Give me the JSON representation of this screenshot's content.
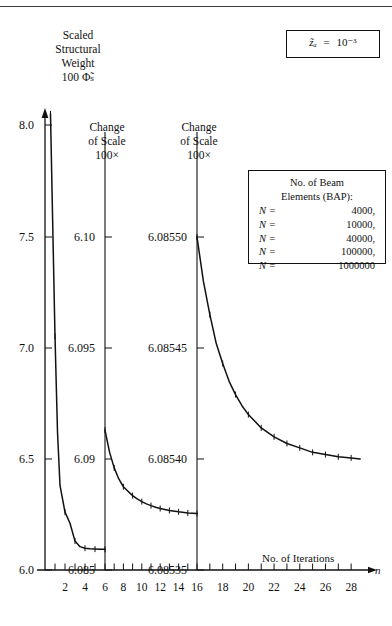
{
  "figure": {
    "top_rule": true,
    "y_axis_title_lines": [
      "Scaled",
      "Structural",
      "Weight",
      "100 Φ̃ₛ"
    ],
    "x_axis_title": "No. of Iterations",
    "x_axis_symbol": "n",
    "parameter_box": {
      "symbol": "z̃ₐ",
      "equals": "=",
      "value": "10⁻³"
    },
    "scale_change_1": {
      "line1": "Change",
      "line2": "of Scale",
      "line3": "100×"
    },
    "scale_change_2": {
      "line1": "Change",
      "line2": "of Scale",
      "line3": "100×"
    },
    "legend": {
      "title_line1": "No. of Beam",
      "title_line2": "Elements (BAP):",
      "entries": [
        {
          "label": "N =",
          "value": "4000,"
        },
        {
          "label": "N =",
          "value": "10000,"
        },
        {
          "label": "N =",
          "value": "40000,"
        },
        {
          "label": "N =",
          "value": "100000,"
        },
        {
          "label": "N =",
          "value": "1000000"
        }
      ]
    }
  },
  "chart_data": {
    "type": "line",
    "xlabel": "No. of Iterations",
    "ylabel": "Scaled Structural Weight 100 Φ̃_S",
    "xlim": [
      0,
      29
    ],
    "x_ticks_major": [
      2,
      4,
      6,
      8,
      10,
      12,
      14,
      16,
      18,
      20,
      22,
      24,
      26,
      28
    ],
    "x_ticks_minor": [
      1,
      3,
      5,
      7,
      9,
      11,
      13,
      15,
      17,
      19,
      21,
      23,
      25,
      27
    ],
    "grid": false,
    "legend_position": "top-right",
    "annotations": [
      "Change of Scale 100× at n=6",
      "Change of Scale 100× at n=16"
    ],
    "panels": [
      {
        "name": "panel-1",
        "x_range": [
          0,
          6
        ],
        "y_ticks": [
          "8.0",
          "7.5",
          "7.0",
          "6.5",
          "6.0"
        ],
        "y_values": [
          8.0,
          7.5,
          7.0,
          6.5,
          6.0
        ],
        "ylim": [
          5.93,
          8.08
        ],
        "series": [
          {
            "name": "N = 4000",
            "x": [
              0.55,
              0.75,
              1.0,
              1.25,
              1.5,
              2.0,
              2.5,
              3.0,
              3.5,
              4.0,
              4.5,
              5.0,
              5.5,
              6.0
            ],
            "y": [
              8.05,
              7.6,
              7.05,
              6.62,
              6.38,
              6.26,
              6.21,
              6.13,
              6.105,
              6.098,
              6.095,
              6.094,
              6.093,
              6.093
            ]
          }
        ]
      },
      {
        "name": "panel-2",
        "x_range": [
          6,
          16
        ],
        "y_ticks": [
          "6.10",
          "6.095",
          "6.09",
          "6.085"
        ],
        "y_values": [
          6.1,
          6.095,
          6.09,
          6.085
        ],
        "ylim": [
          6.0835,
          6.1013
        ],
        "series": [
          {
            "name": "N = 4000 (100x scale)",
            "x": [
              6.0,
              6.5,
              7.0,
              7.5,
              8.0,
              8.5,
              9.0,
              9.5,
              10.0,
              10.5,
              11.0,
              11.5,
              12.0,
              13.0,
              14.0,
              15.0,
              16.0
            ],
            "y": [
              6.0913,
              6.0903,
              6.0896,
              6.0891,
              6.08875,
              6.08855,
              6.08835,
              6.0882,
              6.08808,
              6.08798,
              6.0879,
              6.08783,
              6.08777,
              6.08768,
              6.08762,
              6.08757,
              6.08754
            ]
          }
        ]
      },
      {
        "name": "panel-3",
        "x_range": [
          16,
          29
        ],
        "y_ticks": [
          "6.08550",
          "6.08545",
          "6.08540",
          "6.08535"
        ],
        "y_values": [
          6.0855,
          6.08545,
          6.0854,
          6.08535
        ],
        "ylim": [
          6.085335,
          6.085512
        ],
        "series": [
          {
            "name": "N = 4000 (10000x scale)",
            "x": [
              16.0,
              16.5,
              17.0,
              17.5,
              18.0,
              18.5,
              19.0,
              19.5,
              20.0,
              20.5,
              21.0,
              22.0,
              23.0,
              24.0,
              25.0,
              26.0,
              27.0,
              28.0,
              28.7
            ],
            "y": [
              6.0855,
              6.08548,
              6.085465,
              6.085452,
              6.085443,
              6.085435,
              6.085429,
              6.085424,
              6.08542,
              6.085417,
              6.085414,
              6.08541,
              6.085407,
              6.085405,
              6.085403,
              6.085402,
              6.085401,
              6.0854005,
              6.0854
            ]
          }
        ]
      }
    ]
  }
}
